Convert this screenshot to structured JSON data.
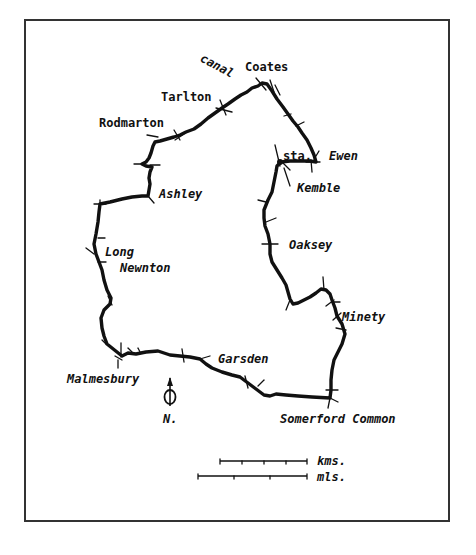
{
  "map": {
    "places": {
      "canal": "canal",
      "coates": "Coates",
      "tarlton": "Tarlton",
      "rodmarton": "Rodmarton",
      "station": "sta.",
      "ewen": "Ewen",
      "kemble": "Kemble",
      "ashley": "Ashley",
      "oaksey": "Oaksey",
      "long": "Long",
      "newnton": "Newnton",
      "minety": "Minety",
      "garsden": "Garsden",
      "malmesbury": "Malmesbury",
      "somerford_common": "Somerford Common"
    },
    "north_label": "N.",
    "scale": {
      "kms_label": "kms.",
      "mls_label": "mls.",
      "kms_divisions": 4,
      "mls_divisions": 3
    },
    "colors": {
      "route": "#111111",
      "frame": "#333333",
      "background": "#ffffff"
    }
  }
}
